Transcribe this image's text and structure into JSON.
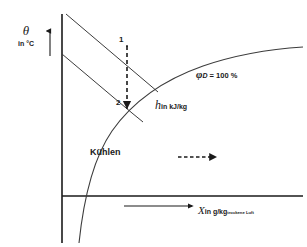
{
  "diagram": {
    "axes": {
      "y": {
        "symbol": "θ",
        "unit": "in °C",
        "name": "temperature-axis"
      },
      "x": {
        "symbol": "X",
        "unit": "in g/kg",
        "unit_subscript": "trockene Luft",
        "name": "humidity-ratio-axis"
      }
    },
    "curves": {
      "saturation": {
        "label_symbol": "φ",
        "label_subscript": "D",
        "label_value": "= 100 %",
        "label_full": "φD = 100 %"
      },
      "enthalpy": {
        "symbol": "h",
        "unit": "in  kJ/kg",
        "label_full": "h in kJ/kg",
        "line_count": 2
      }
    },
    "states": [
      {
        "id": "1",
        "label": "1",
        "role": "inlet-state"
      },
      {
        "id": "2",
        "label": "2",
        "role": "outlet-state"
      }
    ],
    "process": {
      "label": "Kühlen",
      "direction": "downward",
      "arrow_style": "dashed"
    },
    "legend_arrow": {
      "label": "",
      "style": "dashed",
      "direction": "right"
    },
    "colors": {
      "line": "#1a1a1a",
      "curve": "#3c3c3c",
      "background": "#ffffff",
      "text": "#1a1a1a"
    }
  }
}
